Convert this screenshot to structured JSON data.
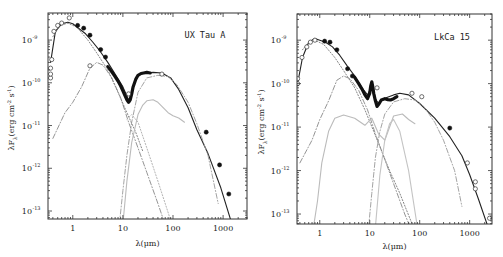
{
  "chart_data": [
    {
      "type": "line",
      "title": "UX Tau A",
      "xlabel": "λ(μm)",
      "ylabel": "λF_λ(erg cm^-2 s^-1)",
      "xscale": "log",
      "yscale": "log",
      "xlim": [
        0.32,
        3000
      ],
      "ylim": [
        6.5e-14,
        4.3e-09
      ],
      "xticks": [
        {
          "v": 1,
          "label": "1"
        },
        {
          "v": 10,
          "label": "10"
        },
        {
          "v": 100,
          "label": "100"
        },
        {
          "v": 1000,
          "label": "1000"
        }
      ],
      "yticks": [
        {
          "v": -9,
          "label": "10",
          "exp": "-9"
        },
        {
          "v": -10,
          "label": "10",
          "exp": "-10"
        },
        {
          "v": -11,
          "label": "10",
          "exp": "-11"
        },
        {
          "v": -12,
          "label": "10",
          "exp": "-12"
        },
        {
          "v": -13,
          "label": "10",
          "exp": "-13"
        }
      ],
      "legend": "none",
      "series": [
        {
          "name": "total model",
          "style": "solid",
          "color": "#222222",
          "x": [
            0.36,
            0.45,
            0.6,
            0.8,
            1.0,
            1.3,
            1.8,
            2.5,
            3.5,
            5,
            7,
            10,
            13,
            15,
            17,
            20,
            25,
            30,
            40,
            60,
            90,
            130,
            200,
            300,
            500,
            900,
            1500
          ],
          "y": [
            3e-10,
            1.6e-09,
            2.4e-09,
            2.6e-09,
            2.4e-09,
            1.9e-09,
            1.4e-09,
            9e-10,
            5.5e-10,
            3e-10,
            1.6e-10,
            8e-11,
            4e-11,
            5.5e-11,
            1e-10,
            1.5e-10,
            1.65e-10,
            1.7e-10,
            1.75e-10,
            1.7e-10,
            1.3e-10,
            7e-11,
            2.6e-11,
            8e-12,
            2.2e-12,
            3.5e-13,
            5e-14
          ]
        },
        {
          "name": "IRS spectrum",
          "style": "thick",
          "color": "#111111",
          "x": [
            5,
            6,
            7,
            8,
            9,
            10,
            11,
            12,
            13,
            14,
            15,
            16,
            18,
            20,
            23,
            26,
            30,
            35
          ],
          "y": [
            2.4e-10,
            1.8e-10,
            1.4e-10,
            1.1e-10,
            8.5e-11,
            6.5e-11,
            5e-11,
            4e-11,
            3.5e-11,
            4e-11,
            5.5e-11,
            8e-11,
            1.2e-10,
            1.5e-10,
            1.65e-10,
            1.7e-10,
            1.75e-10,
            1.7e-10
          ]
        },
        {
          "name": "stellar photosphere",
          "style": "dotted",
          "color": "#777777",
          "x": [
            0.4,
            0.55,
            0.8,
            1.2,
            2,
            3,
            5,
            8,
            12,
            18,
            25
          ],
          "y": [
            1.2e-09,
            2.2e-09,
            2.5e-09,
            2e-09,
            1e-09,
            5e-10,
            2e-10,
            6e-11,
            2e-11,
            7e-12,
            2.5e-12
          ]
        },
        {
          "name": "inner disk wall / accretion",
          "style": "dashdot",
          "color": "#888888",
          "x": [
            0.4,
            0.7,
            1.0,
            1.5,
            2.2,
            3,
            4,
            6,
            9,
            13,
            20,
            30,
            50,
            90
          ],
          "y": [
            5e-12,
            2e-11,
            3.5e-11,
            8e-11,
            2.2e-10,
            3e-10,
            2.6e-10,
            1.3e-10,
            4.5e-11,
            1.2e-11,
            3e-12,
            8e-13,
            1.5e-13,
            2e-14
          ]
        },
        {
          "name": "outer disk wall",
          "style": "dashdot",
          "color": "#999999",
          "x": [
            8.5,
            10,
            12,
            15,
            20,
            30,
            50,
            80,
            120,
            200,
            300,
            500,
            800
          ],
          "y": [
            5e-14,
            3e-13,
            2e-12,
            1.2e-11,
            6e-11,
            1.3e-10,
            1.5e-10,
            1.4e-10,
            9e-11,
            3.5e-11,
            1.1e-11,
            2e-12,
            1.5e-13
          ]
        },
        {
          "name": "optically thin dust",
          "style": "solid-light",
          "color": "#bbbbbb",
          "x": [
            10,
            12,
            15,
            20,
            25,
            30,
            40,
            50,
            60,
            80,
            100,
            130,
            170
          ],
          "y": [
            5e-14,
            5e-13,
            4e-12,
            1.8e-11,
            3e-11,
            3.8e-11,
            4e-11,
            3.5e-11,
            2.8e-11,
            2e-11,
            1.7e-11,
            1.5e-11,
            1.2e-11
          ]
        },
        {
          "name": "dotted optically thin",
          "style": "dotted",
          "color": "#aaaaaa",
          "x": [
            12,
            15,
            20,
            30,
            50,
            90
          ],
          "y": [
            1.4e-11,
            1.8e-11,
            1.2e-11,
            3e-12,
            5e-13,
            6e-14
          ]
        }
      ],
      "points": {
        "open": [
          [
            0.36,
            1.3e-10
          ],
          [
            0.36,
            1.6e-10
          ],
          [
            0.36,
            2.2e-10
          ],
          [
            0.38,
            3.5e-10
          ],
          [
            0.42,
            1.6e-09
          ],
          [
            0.5,
            2.2e-09
          ],
          [
            0.6,
            2.5e-09
          ],
          [
            0.85,
            3.3e-09
          ],
          [
            2.2,
            2.5e-10
          ],
          [
            13,
            5.5e-11
          ],
          [
            60,
            1.6e-10
          ]
        ],
        "filled": [
          [
            1.25,
            2.2e-09
          ],
          [
            1.65,
            1.9e-09
          ],
          [
            2.2,
            1.3e-09
          ],
          [
            3.6,
            6e-10
          ],
          [
            4.5,
            4e-10
          ],
          [
            460,
            7e-12
          ],
          [
            850,
            1.2e-12
          ],
          [
            1300,
            2.5e-13
          ]
        ]
      }
    },
    {
      "type": "line",
      "title": "LkCa 15",
      "xlabel": "λ(μm)",
      "ylabel": "λF_λ(erg cm^-2 s^-1)",
      "xscale": "log",
      "yscale": "log",
      "xlim": [
        0.35,
        2800
      ],
      "ylim": [
        5.9e-14,
        4e-09
      ],
      "xticks": [
        {
          "v": 1,
          "label": "1"
        },
        {
          "v": 10,
          "label": "10"
        },
        {
          "v": 100,
          "label": "100"
        },
        {
          "v": 1000,
          "label": "1000"
        }
      ],
      "yticks": [
        {
          "v": -9,
          "label": "10",
          "exp": "-9"
        },
        {
          "v": -10,
          "label": "10",
          "exp": "-10"
        },
        {
          "v": -11,
          "label": "10",
          "exp": "-11"
        },
        {
          "v": -12,
          "label": "10",
          "exp": "-12"
        },
        {
          "v": -13,
          "label": "10",
          "exp": "-13"
        }
      ],
      "legend": "none",
      "series": [
        {
          "name": "total model",
          "style": "solid",
          "color": "#222222",
          "x": [
            0.36,
            0.45,
            0.6,
            0.8,
            1.0,
            1.3,
            1.8,
            2.5,
            3.5,
            5,
            7,
            9,
            10,
            11,
            12,
            13,
            15,
            18,
            22,
            30,
            40,
            60,
            100,
            200,
            400,
            700,
            1000,
            1500,
            2500
          ],
          "y": [
            1e-10,
            4e-10,
            9e-10,
            1.1e-09,
            1e-09,
            9e-10,
            7e-10,
            4.5e-10,
            2.6e-10,
            1.5e-10,
            8e-11,
            5.5e-11,
            7e-11,
            9.5e-11,
            7e-11,
            4.5e-11,
            3.5e-11,
            4.3e-11,
            4.8e-11,
            5.5e-11,
            6e-11,
            5.5e-11,
            3.5e-11,
            1.6e-11,
            6e-12,
            2.2e-12,
            8e-13,
            2.2e-13,
            4e-14
          ]
        },
        {
          "name": "IRS spectrum",
          "style": "thick",
          "color": "#111111",
          "x": [
            5,
            6,
            7,
            8,
            9,
            10,
            10.5,
            11,
            11.5,
            12,
            13,
            14,
            15,
            17,
            20,
            23,
            26,
            30,
            35
          ],
          "y": [
            1.4e-10,
            1e-10,
            7.5e-11,
            5.5e-11,
            4.5e-11,
            6e-11,
            9e-11,
            1.1e-10,
            8.5e-11,
            6e-11,
            4e-11,
            3e-11,
            3.3e-11,
            4.2e-11,
            4.5e-11,
            4.3e-11,
            4.2e-11,
            4.5e-11,
            5e-11
          ]
        },
        {
          "name": "stellar photosphere",
          "style": "dotted",
          "color": "#777777",
          "x": [
            0.45,
            0.6,
            0.8,
            1.2,
            2,
            3,
            5,
            8,
            12,
            18,
            25,
            40,
            70
          ],
          "y": [
            6e-10,
            9e-10,
            1e-09,
            8e-10,
            4e-10,
            2e-10,
            8e-11,
            2.5e-11,
            8e-12,
            2.5e-12,
            1e-12,
            3e-13,
            6e-14
          ]
        },
        {
          "name": "inner disk",
          "style": "dashdot",
          "color": "#888888",
          "x": [
            0.4,
            0.7,
            1.0,
            1.5,
            2.2,
            3,
            4,
            6,
            9,
            13,
            20,
            30,
            50,
            70
          ],
          "y": [
            1.5e-12,
            5e-12,
            1.5e-11,
            4e-11,
            1.2e-10,
            1.5e-10,
            1.3e-10,
            7e-11,
            2.5e-11,
            7e-12,
            1.8e-12,
            5e-13,
            1e-13,
            4e-14
          ]
        },
        {
          "name": "outer disk wall",
          "style": "dashdot",
          "color": "#999999",
          "x": [
            9.5,
            11,
            13,
            16,
            20,
            30,
            50,
            80,
            120,
            200,
            300,
            500,
            700
          ],
          "y": [
            5e-14,
            3e-13,
            2e-12,
            8e-12,
            2e-11,
            3.8e-11,
            4.5e-11,
            4.2e-11,
            3e-11,
            1.3e-11,
            5e-12,
            1e-12,
            1.5e-13
          ]
        },
        {
          "name": "optically thin dust",
          "style": "solid-light",
          "color": "#bbbbbb",
          "x": [
            0.75,
            0.9,
            1.1,
            1.5,
            2,
            3,
            5,
            8,
            11,
            15,
            20,
            30,
            45,
            60,
            80
          ],
          "y": [
            5e-14,
            2e-13,
            1.5e-12,
            8e-12,
            1.6e-11,
            1.9e-11,
            1.6e-11,
            1.1e-11,
            1.6e-11,
            7e-12,
            5e-12,
            1.8e-11,
            2e-11,
            1.5e-11,
            1.2e-11
          ]
        },
        {
          "name": "optically thin dust 2",
          "style": "solid-light",
          "color": "#c4c4c4",
          "x": [
            13,
            16,
            20,
            25,
            30,
            40,
            60,
            90
          ],
          "y": [
            5e-14,
            8e-13,
            5e-12,
            1.2e-11,
            1.5e-11,
            8e-12,
            1e-12,
            5e-14
          ]
        }
      ],
      "points": {
        "open": [
          [
            0.36,
            1e-10
          ],
          [
            0.36,
            1.3e-10
          ],
          [
            0.44,
            4e-10
          ],
          [
            0.55,
            7e-10
          ],
          [
            0.65,
            9e-10
          ],
          [
            0.8,
            1e-09
          ],
          [
            14,
            8e-11
          ],
          [
            70,
            6e-11
          ],
          [
            110,
            5e-11
          ],
          [
            900,
            1.5e-12
          ],
          [
            1300,
            5.5e-13
          ],
          [
            1300,
            3.8e-13
          ],
          [
            2500,
            8e-14
          ]
        ],
        "filled": [
          [
            1.25,
            9.5e-10
          ],
          [
            1.6,
            9e-10
          ],
          [
            2.2,
            6e-10
          ],
          [
            3.6,
            2.2e-10
          ],
          [
            4.5,
            1.5e-10
          ],
          [
            400,
            9.5e-12
          ]
        ]
      }
    }
  ]
}
